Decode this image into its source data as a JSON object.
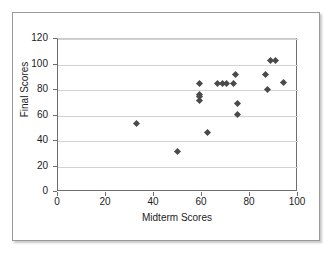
{
  "figure": {
    "background_color": "#ffffff",
    "frame_border_color": "#9a9a9a",
    "marker_color": "#4a4a4a",
    "gridline_color": "#d2d2d2",
    "axis_color": "#6e6e6e"
  },
  "chart_data": {
    "type": "scatter",
    "title": "",
    "xlabel": "Midterm Scores",
    "ylabel": "Final Scores",
    "xlim": [
      0,
      100
    ],
    "ylim": [
      0,
      120
    ],
    "xticks": [
      0,
      20,
      40,
      60,
      80,
      100
    ],
    "yticks": [
      0,
      20,
      40,
      60,
      80,
      100,
      120
    ],
    "xtick_labels": [
      "0",
      "20",
      "40",
      "60",
      "80",
      "100"
    ],
    "ytick_labels": [
      "0",
      "20",
      "40",
      "60",
      "80",
      "100",
      "120"
    ],
    "grid": "horizontal",
    "legend": "none",
    "marker": "diamond",
    "series": [
      {
        "name": "Students",
        "points": [
          {
            "x": 33,
            "y": 53
          },
          {
            "x": 50,
            "y": 31
          },
          {
            "x": 59.5,
            "y": 84
          },
          {
            "x": 59.5,
            "y": 76
          },
          {
            "x": 59.5,
            "y": 74
          },
          {
            "x": 59.5,
            "y": 71
          },
          {
            "x": 62.5,
            "y": 46
          },
          {
            "x": 67,
            "y": 84
          },
          {
            "x": 69,
            "y": 84
          },
          {
            "x": 70.5,
            "y": 84
          },
          {
            "x": 73.5,
            "y": 84
          },
          {
            "x": 74.5,
            "y": 91
          },
          {
            "x": 75,
            "y": 69
          },
          {
            "x": 75,
            "y": 60
          },
          {
            "x": 87,
            "y": 91
          },
          {
            "x": 87.5,
            "y": 80
          },
          {
            "x": 89,
            "y": 102
          },
          {
            "x": 91,
            "y": 102
          },
          {
            "x": 94.5,
            "y": 85
          }
        ]
      }
    ]
  }
}
